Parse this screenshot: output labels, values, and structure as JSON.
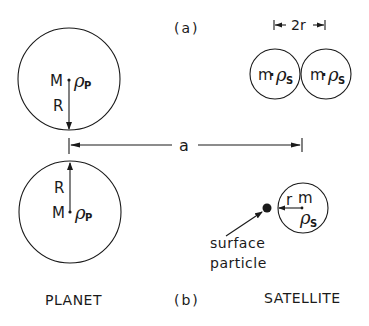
{
  "panel_a": {
    "label": "(a)",
    "planet": {
      "mass": "M",
      "density_symbol": "ρ",
      "density_sub": "P",
      "radius_label": "R"
    },
    "satellites": [
      {
        "mass": "m",
        "dot": "·",
        "density_symbol": "ρ",
        "density_sub": "S"
      },
      {
        "mass": "m",
        "dot": "·",
        "density_symbol": "ρ",
        "density_sub": "S"
      }
    ],
    "diameter_label": "2r"
  },
  "distance_label": "a",
  "panel_b": {
    "label": "(b)",
    "planet": {
      "mass": "M",
      "density_symbol": "ρ",
      "density_sub": "P",
      "radius_label": "R"
    },
    "satellite": {
      "mass": "m",
      "radius_label": "r",
      "density_symbol": "ρ",
      "density_sub": "S"
    },
    "particle_label_line1": "surface",
    "particle_label_line2": "particle"
  },
  "footer": {
    "planet_label": "PLANET",
    "satellite_label": "SATELLITE"
  }
}
